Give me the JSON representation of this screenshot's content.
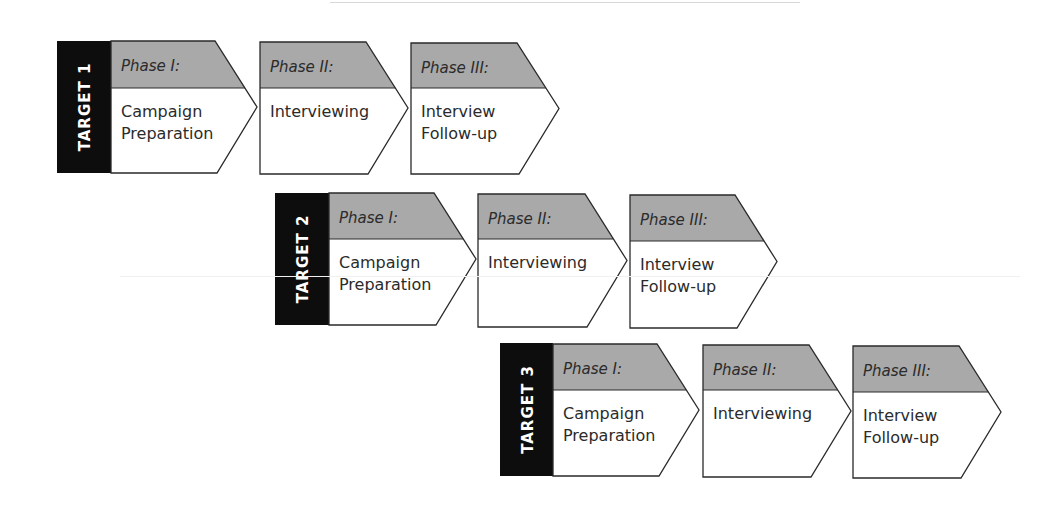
{
  "diagram": {
    "colors": {
      "target_bar": "#0d0d0d",
      "phase_header": "#a9a9a9",
      "body_fill": "#ffffff",
      "stroke": "#2a2a2a",
      "text": "#2b2b2b",
      "target_text": "#ffffff"
    },
    "rows": [
      {
        "target_label": "TARGET 1",
        "bar": {
          "x": 57,
          "y": 41,
          "w": 54,
          "h": 132
        },
        "phases": [
          {
            "title": "Phase I:",
            "lines": [
              "Campaign",
              "Preparation"
            ],
            "x": 111,
            "y": 41,
            "w": 146,
            "h": 132,
            "header_h": 47
          },
          {
            "title": "Phase II:",
            "lines": [
              "Interviewing"
            ],
            "x": 260,
            "y": 42,
            "w": 148,
            "h": 132,
            "header_h": 46
          },
          {
            "title": "Phase III:",
            "lines": [
              "Interview",
              "Follow-up"
            ],
            "x": 411,
            "y": 43,
            "w": 148,
            "h": 131,
            "header_h": 45
          }
        ]
      },
      {
        "target_label": "TARGET 2",
        "bar": {
          "x": 275,
          "y": 193,
          "w": 54,
          "h": 132
        },
        "phases": [
          {
            "title": "Phase I:",
            "lines": [
              "Campaign",
              "Preparation"
            ],
            "x": 329,
            "y": 193,
            "w": 147,
            "h": 132,
            "header_h": 46
          },
          {
            "title": "Phase II:",
            "lines": [
              "Interviewing"
            ],
            "x": 478,
            "y": 194,
            "w": 149,
            "h": 133,
            "header_h": 45
          },
          {
            "title": "Phase III:",
            "lines": [
              "Interview",
              "Follow-up"
            ],
            "x": 630,
            "y": 195,
            "w": 147,
            "h": 133,
            "header_h": 46
          }
        ]
      },
      {
        "target_label": "TARGET 3",
        "bar": {
          "x": 500,
          "y": 343,
          "w": 53,
          "h": 133
        },
        "phases": [
          {
            "title": "Phase I:",
            "lines": [
              "Campaign",
              "Preparation"
            ],
            "x": 553,
            "y": 344,
            "w": 146,
            "h": 132,
            "header_h": 46
          },
          {
            "title": "Phase II:",
            "lines": [
              "Interviewing"
            ],
            "x": 703,
            "y": 345,
            "w": 148,
            "h": 132,
            "header_h": 45
          },
          {
            "title": "Phase III:",
            "lines": [
              "Interview",
              "Follow-up"
            ],
            "x": 853,
            "y": 346,
            "w": 148,
            "h": 132,
            "header_h": 46
          }
        ]
      }
    ]
  }
}
